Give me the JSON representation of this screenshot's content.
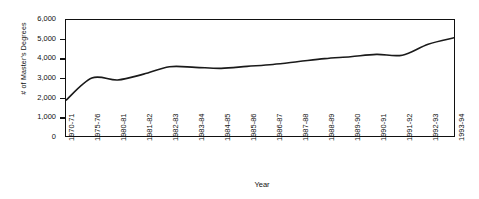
{
  "chart_data": {
    "type": "line",
    "title": "",
    "xlabel": "Year",
    "ylabel": "# of Master's Degrees",
    "categories": [
      "1970-71",
      "1975-76",
      "1980-81",
      "1981-82",
      "1982-83",
      "1983-84",
      "1984-85",
      "1985-86",
      "1986-87",
      "1987-88",
      "1988-89",
      "1989-90",
      "1990-91",
      "1991-92",
      "1992-93",
      "1993-94"
    ],
    "values": [
      1850,
      3000,
      2900,
      3200,
      3580,
      3550,
      3500,
      3600,
      3700,
      3850,
      4000,
      4100,
      4220,
      4180,
      4750,
      5080
    ],
    "series": [
      {
        "name": "# of Master's Degrees",
        "values": [
          1850,
          3000,
          2900,
          3200,
          3580,
          3550,
          3500,
          3600,
          3700,
          3850,
          4000,
          4100,
          4220,
          4180,
          4750,
          5080
        ]
      }
    ],
    "ylim": [
      0,
      6000
    ],
    "ytick_labels": [
      "6,000",
      "5,000",
      "4,000",
      "3,000",
      "2,000",
      "1,000",
      "0"
    ],
    "ytick_values": [
      6000,
      5000,
      4000,
      3000,
      2000,
      1000,
      0
    ],
    "grid": false,
    "legend": false,
    "line_color": "#1a1a1a",
    "background_color": "#ffffff",
    "smoothing": "spline"
  }
}
